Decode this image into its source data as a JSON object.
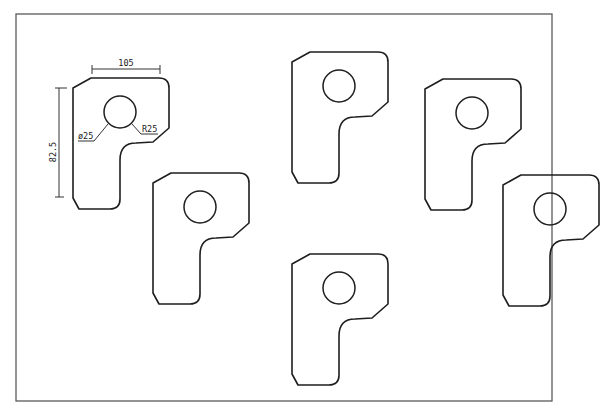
{
  "drawing": {
    "border": {
      "x": 16,
      "y": 14,
      "width": 536,
      "height": 387
    },
    "colors": {
      "outline": "#1e1e1e",
      "border": "#5a5a5a",
      "dimension": "#333333"
    },
    "part_shape": {
      "description": "P-shaped plate with chamfered top-left and bottom-left corners, rounded top-right, stepped notch on right side, and a circular hole",
      "path": "M 0,10 L 18,0 L 86,0 Q 96,0 96,10 L 96,50 L 80,64 L 63,65 Q 47,65 47,82 L 47,121 Q 47,131 37,131 L 6,131 L 0,120 Z",
      "hole": {
        "cx": 47,
        "cy": 34,
        "r": 16
      }
    },
    "parts": [
      {
        "id": "part-1",
        "x": 73,
        "y": 78
      },
      {
        "id": "part-2",
        "x": 292,
        "y": 52
      },
      {
        "id": "part-3",
        "x": 425,
        "y": 79
      },
      {
        "id": "part-4",
        "x": 153,
        "y": 173
      },
      {
        "id": "part-5",
        "x": 292,
        "y": 254
      },
      {
        "id": "part-6",
        "x": 503,
        "y": 175
      }
    ],
    "dimensions": {
      "width": {
        "label": "105"
      },
      "height": {
        "label": "82.5"
      },
      "hole_diameter": {
        "label": "ø25"
      },
      "corner_radius": {
        "label": "R25"
      }
    }
  }
}
